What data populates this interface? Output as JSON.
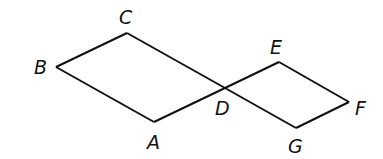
{
  "diagram": {
    "type": "geometry",
    "stroke_color": "#111111",
    "background": "#ffffff",
    "points": {
      "A": {
        "x": 154,
        "y": 122,
        "label": "A",
        "lx": 147,
        "ly": 149
      },
      "B": {
        "x": 56,
        "y": 67,
        "label": "B",
        "lx": 34,
        "ly": 74
      },
      "C": {
        "x": 127,
        "y": 33,
        "label": "C",
        "lx": 119,
        "ly": 24
      },
      "D": {
        "x": 225,
        "y": 88,
        "label": "D",
        "lx": 215,
        "ly": 115
      },
      "E": {
        "x": 279,
        "y": 62,
        "label": "E",
        "lx": 270,
        "ly": 54
      },
      "F": {
        "x": 349,
        "y": 102,
        "label": "F",
        "lx": 355,
        "ly": 115
      },
      "G": {
        "x": 296,
        "y": 128,
        "label": "G",
        "lx": 288,
        "ly": 153
      }
    },
    "segments": [
      [
        "B",
        "C"
      ],
      [
        "C",
        "D"
      ],
      [
        "D",
        "A"
      ],
      [
        "A",
        "B"
      ],
      [
        "D",
        "E"
      ],
      [
        "E",
        "F"
      ],
      [
        "F",
        "G"
      ],
      [
        "G",
        "D"
      ]
    ]
  }
}
